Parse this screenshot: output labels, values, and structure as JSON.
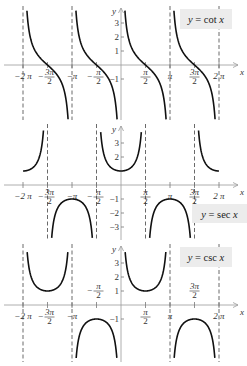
{
  "chart_data": [
    {
      "type": "line",
      "title": "y = cot x",
      "function": "cot",
      "xlabel": "x",
      "ylabel": "y",
      "xlim": [
        -6.6,
        7.0
      ],
      "ylim": [
        -4,
        4
      ],
      "x_ticks": [
        "-2π",
        "-3π/2",
        "-π",
        "-π/2",
        "π/2",
        "π",
        "3π/2",
        "2π"
      ],
      "y_ticks": [
        "3",
        "2",
        "1",
        "-1"
      ],
      "asymptotes": [
        "-2π",
        "-π",
        "π",
        "2π"
      ],
      "series": [
        {
          "name": "cot x",
          "branches": [
            [
              -6.283,
              -3.142
            ],
            [
              -3.142,
              0
            ],
            [
              0,
              3.142
            ],
            [
              3.142,
              6.283
            ]
          ]
        }
      ],
      "grid": false,
      "legend_position": "top-right"
    },
    {
      "type": "line",
      "title": "y = sec x",
      "function": "sec",
      "xlabel": "x",
      "ylabel": "y",
      "xlim": [
        -6.6,
        7.0
      ],
      "ylim": [
        -4,
        4
      ],
      "x_ticks": [
        "-2π",
        "-3π/2",
        "-π",
        "-π/2",
        "π/2",
        "π",
        "3π/2",
        "2π"
      ],
      "y_ticks": [
        "3",
        "2",
        "-1",
        "-2",
        "-3"
      ],
      "asymptotes": [
        "-3π/2",
        "-π/2",
        "π/2",
        "3π/2"
      ],
      "series": [
        {
          "name": "sec x",
          "branches": [
            [
              -6.283,
              -4.712
            ],
            [
              -4.712,
              -1.571
            ],
            [
              -1.571,
              1.571
            ],
            [
              1.571,
              4.712
            ],
            [
              4.712,
              6.283
            ]
          ]
        }
      ],
      "grid": false,
      "legend_position": "bottom-right"
    },
    {
      "type": "line",
      "title": "y = csc x",
      "function": "csc",
      "xlabel": "x",
      "ylabel": "y",
      "xlim": [
        -6.6,
        7.0
      ],
      "ylim": [
        -4,
        4
      ],
      "x_ticks": [
        "-2π",
        "-3π/2",
        "-π",
        "-π/2",
        "π/2",
        "π",
        "3π/2",
        "2π"
      ],
      "y_ticks": [
        "3",
        "2",
        "1",
        "-1"
      ],
      "asymptotes": [
        "-2π",
        "-π",
        "π",
        "2π"
      ],
      "series": [
        {
          "name": "csc x",
          "branches": [
            [
              -6.283,
              -3.142
            ],
            [
              -3.142,
              0
            ],
            [
              0,
              3.142
            ],
            [
              3.142,
              6.283
            ]
          ]
        }
      ],
      "grid": false,
      "legend_position": "top-right"
    }
  ],
  "panels": [
    {
      "legend": "y = cot x",
      "x_axis_label": "x",
      "y_axis_label": "y"
    },
    {
      "legend": "y = sec x",
      "x_axis_label": "x",
      "y_axis_label": "y"
    },
    {
      "legend": "y = csc x",
      "x_axis_label": "x",
      "y_axis_label": "y"
    }
  ],
  "colors": {
    "curve": "#111111",
    "axis": "#999999",
    "asymptote": "#444444",
    "legend_bg": "#ececec"
  }
}
